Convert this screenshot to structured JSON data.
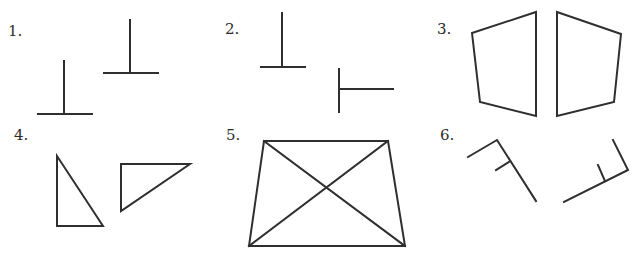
{
  "figures": [
    {
      "id": 1,
      "label": "1.",
      "label_pos": [
        8,
        24
      ],
      "description": "two inverted T shapes"
    },
    {
      "id": 2,
      "label": "2.",
      "label_pos": [
        225,
        22
      ],
      "description": "inverted T and rotated T"
    },
    {
      "id": 3,
      "label": "3.",
      "label_pos": [
        437,
        22
      ],
      "description": "two mirrored quadrilaterals"
    },
    {
      "id": 4,
      "label": "4.",
      "label_pos": [
        14,
        128
      ],
      "description": "two right triangles"
    },
    {
      "id": 5,
      "label": "5.",
      "label_pos": [
        226,
        128
      ],
      "description": "trapezoid with crossed diagonals"
    },
    {
      "id": 6,
      "label": "6.",
      "label_pos": [
        440,
        128
      ],
      "description": "two bent line figures with ticks"
    }
  ],
  "colors": {
    "stroke": "#2f2f2f",
    "background": "#ffffff",
    "text": "#2b2b2b"
  }
}
